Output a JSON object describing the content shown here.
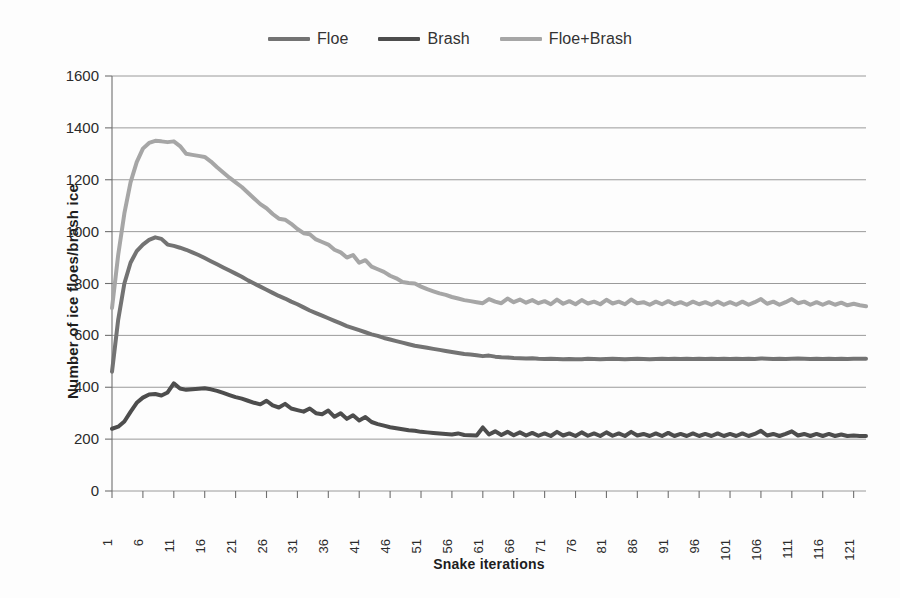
{
  "chart_data": {
    "type": "line",
    "title": "",
    "xlabel": "Snake iterations",
    "ylabel": "Number of ice floes/brash ice",
    "xlim": [
      1,
      123
    ],
    "ylim": [
      0,
      1600
    ],
    "grid": true,
    "legend_position": "top-center",
    "ytick_labels": [
      "1600",
      "1400",
      "1200",
      "1000",
      "800",
      "600",
      "400",
      "200",
      "0"
    ],
    "ytick_values": [
      1600,
      1400,
      1200,
      1000,
      800,
      600,
      400,
      200,
      0
    ],
    "xtick_labels": [
      "1",
      "6",
      "11",
      "16",
      "21",
      "26",
      "31",
      "36",
      "41",
      "46",
      "51",
      "56",
      "61",
      "66",
      "71",
      "76",
      "81",
      "86",
      "91",
      "96",
      "101",
      "106",
      "111",
      "116",
      "121"
    ],
    "xtick_values": [
      1,
      6,
      11,
      16,
      21,
      26,
      31,
      36,
      41,
      46,
      51,
      56,
      61,
      66,
      71,
      76,
      81,
      86,
      91,
      96,
      101,
      106,
      111,
      116,
      121
    ],
    "x": [
      1,
      2,
      3,
      4,
      5,
      6,
      7,
      8,
      9,
      10,
      11,
      12,
      13,
      14,
      15,
      16,
      17,
      18,
      19,
      20,
      21,
      22,
      23,
      24,
      25,
      26,
      27,
      28,
      29,
      30,
      31,
      32,
      33,
      34,
      35,
      36,
      37,
      38,
      39,
      40,
      41,
      42,
      43,
      44,
      45,
      46,
      47,
      48,
      49,
      50,
      51,
      52,
      53,
      54,
      55,
      56,
      57,
      58,
      59,
      60,
      61,
      62,
      63,
      64,
      65,
      66,
      67,
      68,
      69,
      70,
      71,
      72,
      73,
      74,
      75,
      76,
      77,
      78,
      79,
      80,
      81,
      82,
      83,
      84,
      85,
      86,
      87,
      88,
      89,
      90,
      91,
      92,
      93,
      94,
      95,
      96,
      97,
      98,
      99,
      100,
      101,
      102,
      103,
      104,
      105,
      106,
      107,
      108,
      109,
      110,
      111,
      112,
      113,
      114,
      115,
      116,
      117,
      118,
      119,
      120,
      121,
      122,
      123
    ],
    "series": [
      {
        "name": "Floe",
        "color": "#737373",
        "linewidth": 4,
        "values": [
          460,
          660,
          800,
          880,
          925,
          950,
          968,
          978,
          972,
          950,
          945,
          938,
          930,
          920,
          910,
          898,
          886,
          874,
          862,
          850,
          838,
          826,
          812,
          800,
          788,
          776,
          764,
          752,
          742,
          730,
          720,
          708,
          696,
          686,
          676,
          666,
          656,
          646,
          636,
          628,
          620,
          612,
          604,
          598,
          590,
          584,
          578,
          572,
          566,
          560,
          556,
          552,
          548,
          544,
          540,
          536,
          532,
          528,
          526,
          523,
          520,
          522,
          518,
          516,
          515,
          513,
          512,
          511,
          512,
          510,
          509,
          510,
          509,
          508,
          509,
          508,
          508,
          510,
          509,
          508,
          509,
          510,
          509,
          508,
          509,
          510,
          509,
          508,
          509,
          510,
          509,
          510,
          509,
          510,
          509,
          510,
          509,
          510,
          509,
          510,
          509,
          510,
          509,
          510,
          509,
          511,
          510,
          509,
          510,
          509,
          510,
          511,
          510,
          509,
          510,
          509,
          510,
          509,
          510,
          509,
          510,
          510,
          510
        ]
      },
      {
        "name": "Brash",
        "color": "#4d4d4d",
        "linewidth": 4,
        "values": [
          240,
          248,
          268,
          305,
          340,
          360,
          372,
          374,
          368,
          380,
          415,
          395,
          390,
          392,
          394,
          396,
          392,
          386,
          378,
          370,
          362,
          356,
          348,
          340,
          334,
          348,
          330,
          322,
          336,
          318,
          312,
          306,
          318,
          300,
          296,
          310,
          286,
          300,
          278,
          292,
          272,
          285,
          266,
          258,
          252,
          246,
          242,
          238,
          234,
          232,
          228,
          226,
          224,
          222,
          220,
          218,
          222,
          216,
          215,
          214,
          245,
          218,
          230,
          216,
          228,
          215,
          226,
          214,
          224,
          213,
          222,
          212,
          228,
          214,
          222,
          212,
          226,
          213,
          222,
          212,
          226,
          213,
          222,
          212,
          228,
          214,
          220,
          212,
          222,
          212,
          224,
          212,
          220,
          212,
          222,
          212,
          220,
          212,
          222,
          212,
          220,
          212,
          222,
          212,
          220,
          232,
          214,
          220,
          212,
          220,
          230,
          214,
          220,
          212,
          220,
          212,
          220,
          212,
          218,
          212,
          214,
          212,
          212
        ]
      },
      {
        "name": "Floe+Brash",
        "color": "#a6a6a6",
        "linewidth": 4,
        "values": [
          705,
          910,
          1070,
          1190,
          1268,
          1320,
          1342,
          1350,
          1348,
          1345,
          1348,
          1330,
          1300,
          1296,
          1292,
          1288,
          1270,
          1248,
          1228,
          1208,
          1190,
          1172,
          1150,
          1128,
          1106,
          1090,
          1068,
          1050,
          1046,
          1030,
          1010,
          994,
          990,
          970,
          960,
          950,
          930,
          920,
          900,
          910,
          880,
          890,
          865,
          855,
          845,
          830,
          820,
          806,
          802,
          800,
          788,
          778,
          770,
          762,
          756,
          748,
          742,
          736,
          732,
          728,
          724,
          740,
          730,
          724,
          742,
          728,
          738,
          726,
          736,
          724,
          732,
          720,
          738,
          722,
          732,
          720,
          736,
          723,
          730,
          720,
          737,
          723,
          730,
          720,
          738,
          724,
          728,
          718,
          730,
          720,
          732,
          720,
          728,
          718,
          730,
          720,
          728,
          718,
          730,
          718,
          728,
          718,
          730,
          718,
          728,
          740,
          722,
          730,
          718,
          728,
          740,
          724,
          730,
          718,
          728,
          718,
          728,
          718,
          726,
          716,
          722,
          716,
          712
        ]
      }
    ]
  },
  "legend": {
    "entries": [
      {
        "label": "Floe",
        "color": "#737373"
      },
      {
        "label": "Brash",
        "color": "#4d4d4d"
      },
      {
        "label": "Floe+Brash",
        "color": "#a6a6a6"
      }
    ]
  },
  "axes": {
    "y_title": "Number of ice floes/brash ice",
    "x_title": "Snake iterations"
  }
}
